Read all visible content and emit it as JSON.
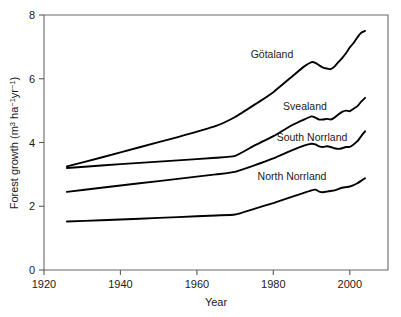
{
  "figure": {
    "background_color": "#ffffff",
    "line_color": "#000000",
    "axis_color": "#5a5a5a"
  },
  "axes": {
    "x_title": "Year",
    "y_title_main": "Forest growth (m",
    "y_title_sup1": "3",
    "y_title_mid": " ha",
    "y_title_sup2": "−1",
    "y_title_mid2": "yr",
    "y_title_sup3": "−1",
    "y_title_end": ")",
    "y_title_plain": "Forest growth (m3 ha -1 yr -1)",
    "x_ticks": [
      "1920",
      "1940",
      "1960",
      "1980",
      "2000"
    ],
    "y_ticks": [
      "0",
      "2",
      "4",
      "6",
      "8"
    ]
  },
  "series_labels": {
    "gotaland": "Götaland",
    "svealand": "Svealand",
    "south_norrland": "South Norrland",
    "north_norrland": "North Norrland"
  },
  "chart_data": {
    "type": "line",
    "title": "",
    "xlabel": "Year",
    "ylabel": "Forest growth (m3 ha-1 yr-1)",
    "xlim": [
      1920,
      2010
    ],
    "ylim": [
      0,
      8
    ],
    "xticks": [
      1920,
      1940,
      1960,
      1980,
      2000
    ],
    "yticks": [
      0,
      2,
      4,
      6,
      8
    ],
    "grid": false,
    "legend": "inline-labels",
    "series": [
      {
        "name": "Götaland",
        "color": "#000000",
        "label_year": 1978,
        "label_value": 6.95,
        "x": [
          1926,
          1935,
          1945,
          1955,
          1965,
          1970,
          1975,
          1980,
          1985,
          1988,
          1990,
          1991,
          1992,
          1993,
          1994,
          1995,
          1996,
          1997,
          1998,
          1999,
          2000,
          2001,
          2002,
          2003,
          2004
        ],
        "y": [
          3.25,
          3.53,
          3.85,
          4.17,
          4.52,
          4.8,
          5.18,
          5.58,
          6.08,
          6.38,
          6.52,
          6.5,
          6.42,
          6.35,
          6.32,
          6.3,
          6.38,
          6.52,
          6.65,
          6.8,
          6.98,
          7.12,
          7.3,
          7.44,
          7.5
        ]
      },
      {
        "name": "Svealand",
        "color": "#000000",
        "label_year": 1980,
        "label_value": 5.3,
        "x": [
          1926,
          1935,
          1945,
          1955,
          1965,
          1970,
          1975,
          1980,
          1985,
          1988,
          1990,
          1991,
          1992,
          1993,
          1994,
          1995,
          1996,
          1997,
          1998,
          1999,
          2000,
          2001,
          2002,
          2003,
          2004
        ],
        "y": [
          3.2,
          3.28,
          3.36,
          3.44,
          3.52,
          3.58,
          3.9,
          4.2,
          4.55,
          4.72,
          4.82,
          4.78,
          4.72,
          4.72,
          4.74,
          4.72,
          4.78,
          4.88,
          4.96,
          5.0,
          4.98,
          5.06,
          5.14,
          5.28,
          5.4
        ]
      },
      {
        "name": "South Norrland",
        "color": "#000000",
        "label_year": 1982,
        "label_value": 4.28,
        "x": [
          1926,
          1935,
          1945,
          1955,
          1965,
          1970,
          1975,
          1980,
          1985,
          1988,
          1990,
          1991,
          1992,
          1993,
          1994,
          1995,
          1996,
          1997,
          1998,
          1999,
          2000,
          2001,
          2002,
          2003,
          2004
        ],
        "y": [
          2.45,
          2.58,
          2.72,
          2.86,
          3.0,
          3.08,
          3.28,
          3.5,
          3.76,
          3.9,
          3.96,
          3.94,
          3.88,
          3.86,
          3.88,
          3.86,
          3.82,
          3.8,
          3.82,
          3.86,
          3.86,
          3.94,
          4.04,
          4.2,
          4.35
        ]
      },
      {
        "name": "North Norrland",
        "color": "#000000",
        "label_year": 1978,
        "label_value": 3.02,
        "x": [
          1926,
          1935,
          1945,
          1955,
          1965,
          1970,
          1975,
          1980,
          1985,
          1988,
          1990,
          1991,
          1992,
          1993,
          1994,
          1995,
          1996,
          1997,
          1998,
          1999,
          2000,
          2001,
          2002,
          2003,
          2004
        ],
        "y": [
          1.52,
          1.56,
          1.61,
          1.66,
          1.71,
          1.74,
          1.92,
          2.1,
          2.3,
          2.42,
          2.5,
          2.52,
          2.46,
          2.44,
          2.46,
          2.48,
          2.5,
          2.54,
          2.58,
          2.6,
          2.62,
          2.66,
          2.72,
          2.8,
          2.88
        ]
      }
    ]
  }
}
